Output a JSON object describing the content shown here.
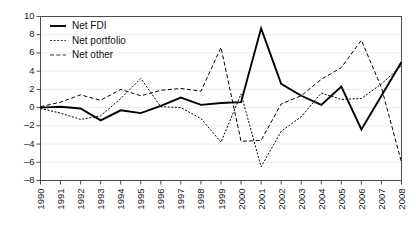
{
  "chart_data": {
    "type": "line",
    "title": "",
    "subtitle": "",
    "xlabel": "",
    "ylabel": "",
    "xlim": [
      1990,
      2008
    ],
    "ylim": [
      -8,
      10
    ],
    "yticks": [
      -8,
      -6,
      -4,
      -2,
      0,
      2,
      4,
      6,
      8,
      10
    ],
    "grid": true,
    "legend_position": "top-left",
    "categories": [
      "1990",
      "1991",
      "1992",
      "1993",
      "1994",
      "1995",
      "1996",
      "1997",
      "1998",
      "1999",
      "2000",
      "2001",
      "2002",
      "2003",
      "2004",
      "2005",
      "2006",
      "2007",
      "2008"
    ],
    "series": [
      {
        "name": "Net FDI",
        "style": "solid",
        "color": "#000000",
        "values": [
          0.0,
          0.1,
          -0.1,
          -1.4,
          -0.3,
          -0.6,
          0.2,
          1.1,
          0.3,
          0.5,
          0.6,
          8.7,
          2.6,
          1.3,
          0.3,
          2.3,
          -2.4,
          1.3,
          5.0
        ]
      },
      {
        "name": "Net portfolio",
        "style": "dotted",
        "color": "#333333",
        "values": [
          -0.1,
          -0.6,
          -1.3,
          -0.9,
          1.0,
          3.2,
          0.1,
          0.0,
          -1.2,
          -3.8,
          1.5,
          -6.5,
          -2.6,
          -1.0,
          1.6,
          0.9,
          1.0,
          2.6,
          4.6
        ]
      },
      {
        "name": "Net other",
        "style": "dashed",
        "color": "#333333",
        "values": [
          0.1,
          0.6,
          1.4,
          0.8,
          2.0,
          1.3,
          1.9,
          2.1,
          1.8,
          6.6,
          -3.7,
          -3.6,
          0.4,
          1.3,
          3.1,
          4.4,
          7.4,
          2.2,
          -6.0
        ]
      }
    ]
  },
  "legend": {
    "items": [
      {
        "label": "Net FDI",
        "style": "solid"
      },
      {
        "label": "Net portfolio",
        "style": "dotted"
      },
      {
        "label": "Net other",
        "style": "dashed"
      }
    ]
  }
}
